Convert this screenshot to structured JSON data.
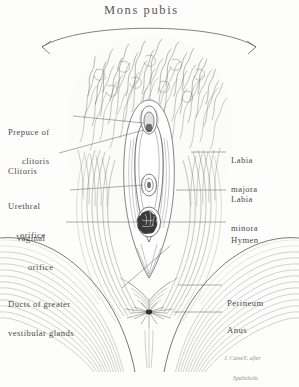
{
  "figure": {
    "title": "Mons pubis",
    "attribution_line1": "J. Cassell, after",
    "attribution_line2": "Spalteholz.",
    "medium": "pen-and-ink anatomical illustration",
    "ink_color": "#4a4a4a",
    "paper_color": "#fdfdfb"
  },
  "labels_left": [
    {
      "id": "prepuce-of-clitoris",
      "line1": "Prepuce of",
      "line2": "clitoris"
    },
    {
      "id": "clitoris",
      "line1": "Clitoris",
      "line2": ""
    },
    {
      "id": "urethral-orifice",
      "line1": "Urethral",
      "line2": "orifice"
    },
    {
      "id": "vaginal-orifice",
      "line1": "Vaginal",
      "line2": "orifice"
    },
    {
      "id": "ducts-of-greater-vestibular-glands",
      "line1": "Ducts of greater",
      "line2": "vestibular glands"
    }
  ],
  "labels_right": [
    {
      "id": "labia-majora",
      "line1": "Labia",
      "line2": "majora"
    },
    {
      "id": "labia-minora",
      "line1": "Labia",
      "line2": "minora"
    },
    {
      "id": "hymen",
      "line1": "Hymen",
      "line2": ""
    },
    {
      "id": "perineum",
      "line1": "Perineum",
      "line2": ""
    },
    {
      "id": "anus",
      "line1": "Anus",
      "line2": ""
    }
  ]
}
